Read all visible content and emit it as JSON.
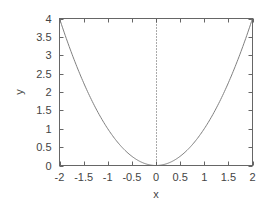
{
  "chart_data": {
    "type": "line",
    "title": "",
    "xlabel": "x",
    "ylabel": "y",
    "xlim": [
      -2,
      2
    ],
    "ylim": [
      0,
      4
    ],
    "grid": false,
    "legend": null,
    "x_ticks": [
      "-2",
      "-1.5",
      "-1",
      "-0.5",
      "0",
      "0.5",
      "1",
      "1.5",
      "2"
    ],
    "y_ticks": [
      "0",
      "0.5",
      "1",
      "1.5",
      "2",
      "2.5",
      "3",
      "3.5",
      "4"
    ],
    "x_tick_values": [
      -2,
      -1.5,
      -1,
      -0.5,
      0,
      0.5,
      1,
      1.5,
      2
    ],
    "y_tick_values": [
      0,
      0.5,
      1,
      1.5,
      2,
      2.5,
      3,
      3.5,
      4
    ],
    "series": [
      {
        "name": "y = x^2",
        "color": "#808080",
        "x": [
          -2,
          -1.75,
          -1.5,
          -1.25,
          -1,
          -0.75,
          -0.5,
          -0.25,
          0,
          0.25,
          0.5,
          0.75,
          1,
          1.25,
          1.5,
          1.75,
          2
        ],
        "y": [
          4,
          3.0625,
          2.25,
          1.5625,
          1,
          0.5625,
          0.25,
          0.0625,
          0,
          0.0625,
          0.25,
          0.5625,
          1,
          1.5625,
          2.25,
          3.0625,
          4
        ]
      }
    ],
    "annotations": [
      {
        "type": "vertical-dotted-line",
        "x": 0,
        "color": "#555555"
      }
    ]
  },
  "colors": {
    "frame": "#666666",
    "curve": "#808080",
    "text": "#444444"
  }
}
